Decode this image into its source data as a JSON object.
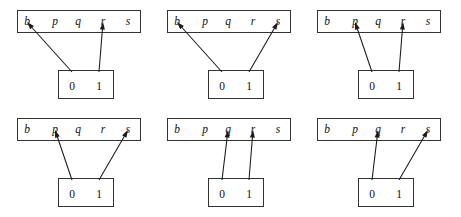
{
  "figure": {
    "width": 461,
    "height": 217,
    "background": "#ffffff",
    "stroke_color": "#333333",
    "arrow_color": "#1a1a1a",
    "text_color": "#111111"
  },
  "top_box": {
    "slots": [
      "b",
      "p",
      "q",
      "r",
      "s"
    ]
  },
  "bottom_box": {
    "slots": [
      "0",
      "1"
    ]
  },
  "panels": [
    {
      "id": "panel-1",
      "x": 0,
      "y": 0,
      "mappings": [
        {
          "from": "0",
          "to": "b"
        },
        {
          "from": "1",
          "to": "r"
        }
      ]
    },
    {
      "id": "panel-2",
      "x": 150,
      "y": 0,
      "mappings": [
        {
          "from": "0",
          "to": "b"
        },
        {
          "from": "1",
          "to": "s"
        }
      ]
    },
    {
      "id": "panel-3",
      "x": 300,
      "y": 0,
      "mappings": [
        {
          "from": "0",
          "to": "p"
        },
        {
          "from": "1",
          "to": "r"
        }
      ]
    },
    {
      "id": "panel-4",
      "x": 0,
      "y": 108,
      "mappings": [
        {
          "from": "0",
          "to": "p"
        },
        {
          "from": "1",
          "to": "s"
        }
      ]
    },
    {
      "id": "panel-5",
      "x": 150,
      "y": 108,
      "mappings": [
        {
          "from": "0",
          "to": "q"
        },
        {
          "from": "1",
          "to": "r"
        }
      ]
    },
    {
      "id": "panel-6",
      "x": 300,
      "y": 108,
      "mappings": [
        {
          "from": "0",
          "to": "q"
        },
        {
          "from": "1",
          "to": "s"
        }
      ]
    }
  ],
  "geometry": {
    "top_box": {
      "x": 17,
      "y": 10,
      "width": 123,
      "height": 22
    },
    "bottom_box": {
      "x": 58,
      "y": 70,
      "width": 55,
      "height": 28
    },
    "slot_centers_x": {
      "b": 27,
      "p": 55,
      "q": 78,
      "r": 103,
      "s": 128
    },
    "bit_centers_x": {
      "0": 72,
      "1": 99
    },
    "slot_baseline_y": 25,
    "bit_baseline_y": 90,
    "arrow_tip_y": 22,
    "arrow_tail_y": 72
  }
}
